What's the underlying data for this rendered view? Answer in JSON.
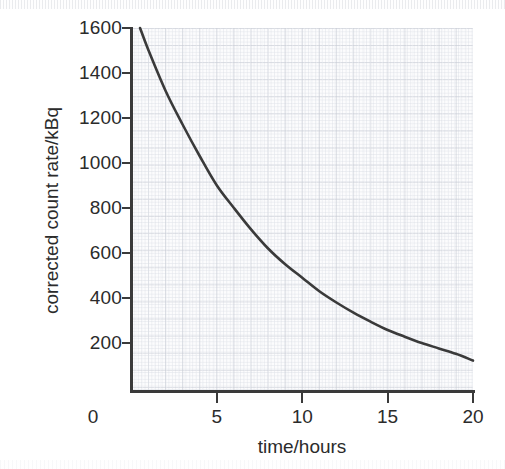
{
  "chart_data": {
    "type": "line",
    "title": "",
    "xlabel": "time/hours",
    "ylabel": "corrected count rate/kBq",
    "xlim": [
      0,
      20
    ],
    "ylim": [
      0,
      1600
    ],
    "xticks": [
      0,
      5,
      10,
      15,
      20
    ],
    "xtick_labels": [
      "0",
      "5",
      "10",
      "15",
      "20"
    ],
    "yticks": [
      200,
      400,
      600,
      800,
      1000,
      1200,
      1400,
      1600
    ],
    "ytick_labels": [
      "200",
      "400",
      "600",
      "800",
      "1000",
      "1200",
      "1400",
      "1600"
    ],
    "grid": true,
    "grid_style": "graph-paper (1 mm fine, 5 mm coarse)",
    "legend": false,
    "series": [
      {
        "name": "corrected count rate",
        "color": "#3a3a3a",
        "line_width": 2.6,
        "description": "exponential radioactive decay, half-life about 5.5 hours",
        "x": [
          0.5,
          1,
          2,
          3,
          4,
          5,
          6,
          7,
          8,
          9,
          10,
          11,
          12,
          13,
          14,
          15,
          16,
          17,
          18,
          19,
          20
        ],
        "y": [
          1600,
          1500,
          1320,
          1170,
          1030,
          900,
          800,
          705,
          620,
          550,
          490,
          430,
          380,
          335,
          295,
          258,
          228,
          200,
          176,
          152,
          122
        ]
      }
    ],
    "annotations": []
  },
  "axes": {
    "y_title": "corrected count rate/kBq",
    "x_title": "time/hours",
    "x_zero_label": "0"
  },
  "colors": {
    "curve": "#3a3a3a",
    "axis": "#3a3a3a",
    "text": "#2b2b2b",
    "grid_fine": "#d8dce4",
    "grid_coarse": "#c7cbd4",
    "plot_background": "#fcfcfd",
    "page_background": "#ffffff"
  }
}
